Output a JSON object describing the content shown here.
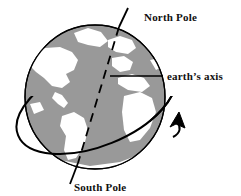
{
  "diagram": {
    "labels": {
      "north_pole": "North Pole",
      "earths_axis": "earth’s axis",
      "south_pole": "South Pole"
    },
    "colors": {
      "ocean": "#999999",
      "land": "#ffffff",
      "outline": "#000000",
      "background": "#ffffff",
      "text": "#101010"
    },
    "globe": {
      "center_x": 95,
      "center_y": 97,
      "radius_x": 70,
      "radius_y": 72
    },
    "axis": {
      "top_x": 128,
      "top_y": 8,
      "bottom_x": 70,
      "bottom_y": 182,
      "style": "dashed-inside-solid-outside",
      "tilt_degrees": 18
    },
    "rotation_ring": {
      "style": "ellipse",
      "tilt_degrees": -22,
      "arrow_direction": "counterclockwise-up-right",
      "arrow_x": 178,
      "arrow_y": 120
    },
    "leader_line": {
      "from_x": 163,
      "from_y": 76,
      "to_x": 110,
      "to_y": 76
    }
  }
}
